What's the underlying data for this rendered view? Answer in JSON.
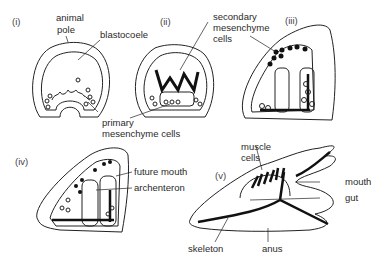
{
  "stages": [
    {
      "id": "i",
      "label": "(i)"
    },
    {
      "id": "ii",
      "label": "(ii)"
    },
    {
      "id": "iii",
      "label": "(iii)"
    },
    {
      "id": "iv",
      "label": "(iv)"
    },
    {
      "id": "v",
      "label": "(v)"
    }
  ],
  "labels": {
    "animal_pole": [
      "animal",
      "pole"
    ],
    "blastocoele": "blastocoele",
    "secondary_mesenchyme": [
      "secondary",
      "mesenchyme",
      "cells"
    ],
    "primary_mesenchyme": [
      "primary",
      "mesenchyme cells"
    ],
    "future_mouth": "future mouth",
    "archenteron": "archenteron",
    "muscle_cells": [
      "muscle",
      "cells"
    ],
    "mouth": "mouth",
    "gut": "gut",
    "skeleton": "skeleton",
    "anus": "anus"
  }
}
